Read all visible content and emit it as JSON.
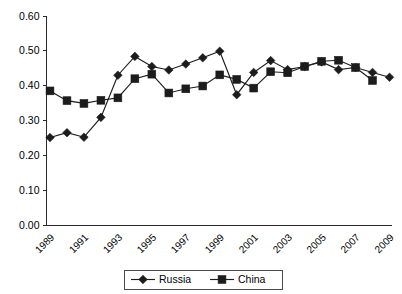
{
  "chart_data": {
    "type": "line",
    "title": "",
    "subtitle": "",
    "xlabel": "",
    "ylabel": "",
    "ylim": [
      0.0,
      0.6
    ],
    "ytick_labels": [
      "0.60",
      "0.50",
      "0.40",
      "0.30",
      "0.20",
      "0.10",
      "0.00"
    ],
    "ytick_values": [
      0.6,
      0.5,
      0.4,
      0.3,
      0.2,
      0.1,
      0.0
    ],
    "grid": false,
    "legend_position": "bottom",
    "x": [
      1989,
      1990,
      1991,
      1992,
      1993,
      1994,
      1995,
      1996,
      1997,
      1998,
      1999,
      2000,
      2001,
      2002,
      2003,
      2004,
      2005,
      2006,
      2007,
      2008,
      2009
    ],
    "xtick_labels": [
      "1989",
      "1991",
      "1993",
      "1995",
      "1997",
      "1999",
      "2001",
      "2003",
      "2005",
      "2007",
      "2009"
    ],
    "xtick_values": [
      1989,
      1991,
      1993,
      1995,
      1997,
      1999,
      2001,
      2003,
      2005,
      2007,
      2009
    ],
    "series": [
      {
        "name": "Russia",
        "marker": "diamond",
        "color": "#1c1c1c",
        "x": [
          1989,
          1990,
          1991,
          1992,
          1993,
          1994,
          1995,
          1996,
          1997,
          1998,
          1999,
          2000,
          2001,
          2002,
          2003,
          2004,
          2005,
          2006,
          2007,
          2008,
          2009
        ],
        "values": [
          0.251,
          0.265,
          0.252,
          0.309,
          0.43,
          0.484,
          0.455,
          0.445,
          0.462,
          0.48,
          0.499,
          0.374,
          0.438,
          0.472,
          0.446,
          0.455,
          0.468,
          0.446,
          0.452,
          0.438,
          0.424
        ]
      },
      {
        "name": "China",
        "marker": "square",
        "color": "#1c1c1c",
        "x": [
          1989,
          1990,
          1991,
          1992,
          1993,
          1994,
          1995,
          1996,
          1997,
          1998,
          1999,
          2000,
          2001,
          2002,
          2003,
          2004,
          2005,
          2006,
          2007,
          2008
        ],
        "values": [
          0.385,
          0.357,
          0.349,
          0.358,
          0.365,
          0.42,
          0.433,
          0.379,
          0.391,
          0.399,
          0.431,
          0.418,
          0.393,
          0.44,
          0.437,
          0.455,
          0.47,
          0.473,
          0.452,
          0.415
        ]
      }
    ]
  },
  "legend": {
    "items": [
      {
        "label": "Russia",
        "marker": "diamond"
      },
      {
        "label": "China",
        "marker": "square"
      }
    ]
  }
}
